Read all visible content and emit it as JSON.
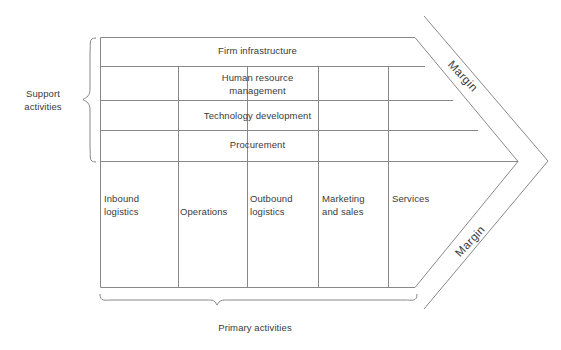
{
  "diagram": {
    "type": "value-chain",
    "line_color": "#888888",
    "text_color": "#3a3a3a",
    "background": "#ffffff"
  },
  "groups": {
    "support": {
      "label": "Support\nactivities",
      "brace_side": "left"
    },
    "primary": {
      "label": "Primary activities",
      "brace_side": "bottom"
    }
  },
  "support_activities": [
    {
      "label": "Firm infrastructure"
    },
    {
      "label": "Human resource\nmanagement"
    },
    {
      "label": "Technology development"
    },
    {
      "label": "Procurement"
    }
  ],
  "primary_activities": [
    {
      "label": "Inbound\nlogistics"
    },
    {
      "label": "Operations"
    },
    {
      "label": "Outbound\nlogistics"
    },
    {
      "label": "Marketing\nand sales"
    },
    {
      "label": "Services"
    }
  ],
  "margins": [
    {
      "label": "Margin",
      "position": "top-right"
    },
    {
      "label": "Margin",
      "position": "bottom-right"
    }
  ]
}
